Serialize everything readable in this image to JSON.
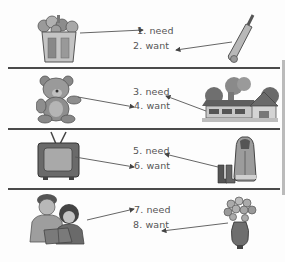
{
  "worksheet": {
    "rows": [
      {
        "left_item": {
          "icon": "trash-can-icon",
          "description": "overflowing garbage can"
        },
        "right_item": {
          "icon": "cricket-bat-icon",
          "description": "cricket bat and ball"
        },
        "labels": [
          {
            "number": "1.",
            "word": "need",
            "text": "1. need"
          },
          {
            "number": "2.",
            "word": "want",
            "text": "2. want"
          }
        ]
      },
      {
        "left_item": {
          "icon": "teddy-bear-icon",
          "description": "teddy bear"
        },
        "right_item": {
          "icon": "house-icon",
          "description": "house with trees"
        },
        "labels": [
          {
            "number": "3.",
            "word": "need",
            "text": "3. need"
          },
          {
            "number": "4.",
            "word": "want",
            "text": "4. want"
          }
        ]
      },
      {
        "left_item": {
          "icon": "television-icon",
          "description": "television set"
        },
        "right_item": {
          "icon": "winter-coat-boots-icon",
          "description": "winter coat and boots"
        },
        "labels": [
          {
            "number": "5.",
            "word": "need",
            "text": "5. need"
          },
          {
            "number": "6.",
            "word": "want",
            "text": "6. want"
          }
        ]
      },
      {
        "left_item": {
          "icon": "parent-child-reading-icon",
          "description": "father and child reading a book"
        },
        "right_item": {
          "icon": "flower-vase-icon",
          "description": "vase of flowers"
        },
        "labels": [
          {
            "number": "7.",
            "word": "need",
            "text": "7. need"
          },
          {
            "number": "8.",
            "word": "want",
            "text": "8. want"
          }
        ]
      }
    ]
  },
  "colors": {
    "ink": "#4a4a4a",
    "text": "#555555",
    "paper": "#fdfdfd"
  }
}
